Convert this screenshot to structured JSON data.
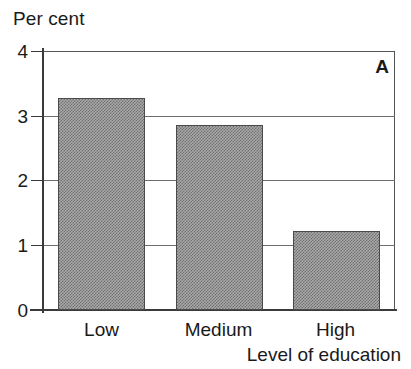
{
  "figure": {
    "panel_label": "A",
    "y_axis_caption": "Per cent",
    "x_axis_caption": "Level of education"
  },
  "chart_data": {
    "type": "bar",
    "title": "",
    "subtitle": "",
    "panel_label": "A",
    "categories": [
      "Low",
      "Medium",
      "High"
    ],
    "values": [
      3.27,
      2.86,
      1.22
    ],
    "series": [
      {
        "name": "Per cent",
        "values": [
          3.27,
          2.86,
          1.22
        ]
      }
    ],
    "xlabel": "Level of education",
    "ylabel": "Per cent",
    "ylim": [
      0,
      4
    ],
    "yticks": [
      0,
      1,
      2,
      3,
      4
    ],
    "ytick_labels": [
      "0",
      "1",
      "2",
      "3",
      "4"
    ],
    "grid": "horizontal",
    "legend": "none",
    "bar_fill": "#a8a8a8",
    "bar_edge": "#4a4a4a",
    "axis_color": "#3a3a3a",
    "grid_color": "#6e6e6e",
    "background": "#ffffff",
    "annotations": []
  },
  "y_ticks": [
    {
      "label": "4",
      "value": 4
    },
    {
      "label": "3",
      "value": 3
    },
    {
      "label": "2",
      "value": 2
    },
    {
      "label": "1",
      "value": 1
    },
    {
      "label": "0",
      "value": 0
    }
  ],
  "bars": [
    {
      "category": "Low",
      "value": 3.27
    },
    {
      "category": "Medium",
      "value": 2.86
    },
    {
      "category": "High",
      "value": 1.22
    }
  ]
}
